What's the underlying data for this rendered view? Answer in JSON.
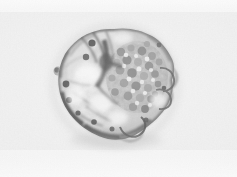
{
  "image": {
    "kind": "light-microscopy-micrograph",
    "subject": "blastocyst-stage embryo / rounded cell cluster",
    "modality": "brightfield",
    "color_mode": "grayscale",
    "width_px": 237,
    "height_px": 177,
    "caption": "",
    "background_color": "#f0f0f0",
    "background_highlight": "#fbfbfb",
    "rim_color": "#2b2b2b",
    "mid_tone_color": "#8a8a8a",
    "light_tone_color": "#e6e6e6",
    "darkest_value": "#171717",
    "lightest_value": "#ffffff"
  },
  "specimen": {
    "center_x": 115,
    "center_y": 85,
    "radius_x": 58,
    "radius_y": 55,
    "outline_points": "114,29 128,28 141,31 152,36 161,43 166,52 171,57 175,65 174,74 170,82 172,90 170,99 164,109 156,118 147,126 139,133 130,138 120,140 109,139 98,135 88,129 79,121 71,112 65,102 61,91 59,80 60,69 64,58 71,48 80,40 91,33 102,30",
    "blebs": [
      {
        "name": "right-upper-bleb",
        "cx": 168,
        "cy": 78,
        "rx": 9,
        "ry": 11
      },
      {
        "name": "right-lower-bleb",
        "cx": 163,
        "cy": 95,
        "rx": 8,
        "ry": 9
      },
      {
        "name": "bottom-bleb",
        "cx": 131,
        "cy": 132,
        "rx": 11,
        "ry": 9
      },
      {
        "name": "left-small-bleb",
        "cx": 58,
        "cy": 72,
        "rx": 4,
        "ry": 4
      }
    ]
  },
  "regions": [
    {
      "name": "trophectoderm-rim",
      "tone": "#3a3a3a"
    },
    {
      "name": "inner-cell-mass",
      "tone": "#6e6e6e",
      "cx": 136,
      "cy": 76
    },
    {
      "name": "blastocoel-cavity",
      "tone": "#dedede",
      "cx": 92,
      "cy": 92
    },
    {
      "name": "upper-left-fold",
      "tone": "#4a4a4a",
      "cx": 92,
      "cy": 45
    },
    {
      "name": "central-dark-ridge",
      "tone": "#2e2e2e",
      "cx": 106,
      "cy": 62
    }
  ],
  "granules": {
    "count": 74,
    "description": "fine cytoplasmic granules / blastomere cells",
    "tone_range": [
      "#4b4b4b",
      "#9c9c9c"
    ]
  },
  "overlays": {
    "scalebar_visible": false,
    "annotation_text": "",
    "label_text": ""
  }
}
